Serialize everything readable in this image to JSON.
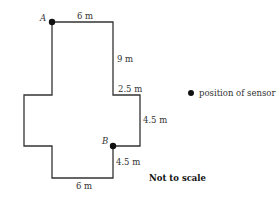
{
  "diagram": {
    "points": {
      "A": {
        "label": "A"
      },
      "B": {
        "label": "B"
      }
    },
    "dimensions": {
      "top": "6 m",
      "right_upper": "9 m",
      "step_right": "2.5 m",
      "right_lower": "4.5 m",
      "below_B": "4.5 m",
      "bottom": "6 m"
    },
    "legend": {
      "marker": "filled-circle",
      "label": "position of sensor"
    },
    "note": "Not to scale",
    "colors": {
      "line": "#333333",
      "marker": "#111111"
    }
  }
}
